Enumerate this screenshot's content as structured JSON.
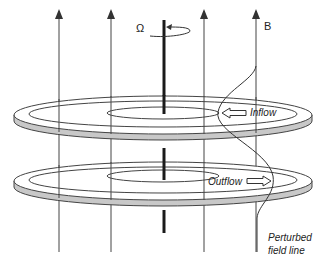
{
  "figure": {
    "labels": {
      "omega": "Ω",
      "field": "B",
      "inflow": "Inflow",
      "outflow": "Outflow",
      "perturbed_line1": "Perturbed",
      "perturbed_line2": "field line"
    },
    "colors": {
      "line": "#333333",
      "axis": "#1a1a1a",
      "disc_edge": "#c8c8c8",
      "background": "#ffffff"
    },
    "field_lines_x": [
      59,
      111,
      204,
      256
    ],
    "discs": [
      {
        "name": "upper-disc",
        "cy": 115,
        "flow": "Inflow"
      },
      {
        "name": "lower-disc",
        "cy": 181,
        "flow": "Outflow"
      }
    ]
  }
}
